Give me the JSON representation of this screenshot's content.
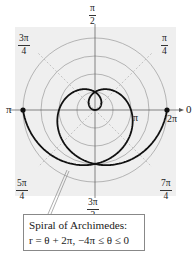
{
  "chart_data": {
    "type": "line",
    "subtype": "polar",
    "title": "",
    "series": [
      {
        "name": "Spiral of Archimedes",
        "equation": "r = θ + 2π",
        "theta_range": [
          -12.566,
          0
        ],
        "theta_range_label": "-4π ≤ θ ≤ 0",
        "endpoints": [
          {
            "theta": "-4π",
            "r": "-2π",
            "cartesian_note": "plotted at angle π side (left)"
          },
          {
            "theta": "0",
            "r": "2π",
            "cartesian_note": "plotted at angle 0 side (right)"
          }
        ]
      }
    ],
    "angle_labels": [
      "0",
      "π/4",
      "π/2",
      "3π/4",
      "π",
      "5π/4",
      "3π/2",
      "7π/4"
    ],
    "radial_labels": [
      "π",
      "2π"
    ],
    "grid_circles_r": [
      "π/2",
      "π",
      "3π/2",
      "2π"
    ],
    "grid": true,
    "annotation": "Spiral of Archimedes: r = θ + 2π, −4π ≤ θ ≤ 0"
  },
  "labels": {
    "angle_0": "0",
    "angle_pi": "π",
    "angle_pi_over_2": {
      "num": "π",
      "den": "2"
    },
    "angle_3pi_over_4": {
      "num": "3π",
      "den": "4"
    },
    "angle_pi_over_4": {
      "num": "π",
      "den": "4"
    },
    "angle_5pi_over_4": {
      "num": "5π",
      "den": "4"
    },
    "angle_7pi_over_4": {
      "num": "7π",
      "den": "4"
    },
    "angle_3pi_over_2": {
      "num": "3π",
      "den": "2"
    },
    "radial_pi": "π",
    "radial_2pi": "2π"
  },
  "caption": {
    "line1": "Spiral of Archimedes:",
    "line2": "r = θ + 2π, −4π ≤ θ ≤ 0"
  },
  "colors": {
    "panel_bg": "#efefef",
    "grid_circle": "#9a9a9a",
    "grid_diagonal": "#b8b8b8",
    "axis": "#555555",
    "curve": "#111111"
  }
}
